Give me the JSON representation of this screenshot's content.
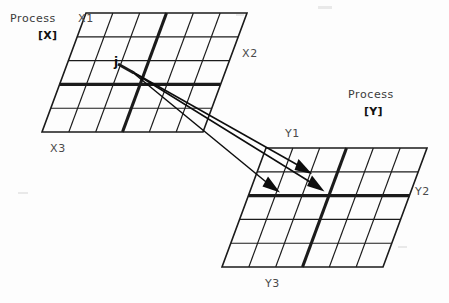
{
  "figure": {
    "background_color": "#fdfdfd",
    "line_color": "#1b1b1b",
    "text_color": "#3b3b3b"
  },
  "process_x": {
    "caption": "Process",
    "bracket_label": "[X]",
    "axis_labels": {
      "top": "X1",
      "right": "X2",
      "bottom": "X3"
    },
    "node_label": "j",
    "grid": {
      "cols": 6,
      "rows": 5
    },
    "highlight": {
      "column_index": 3,
      "row_index": 3
    }
  },
  "process_y": {
    "caption": "Process",
    "bracket_label": "[Y]",
    "axis_labels": {
      "top": "Y1",
      "right": "Y2",
      "bottom": "Y3"
    },
    "grid": {
      "cols": 6,
      "rows": 5
    },
    "highlight": {
      "column_index": 3,
      "row_index": 2
    }
  },
  "arrows": {
    "count": 3,
    "source": "j",
    "targets": [
      "Y1 row cell",
      "Y mid-row cell left",
      "Y mid-row cell right"
    ]
  }
}
